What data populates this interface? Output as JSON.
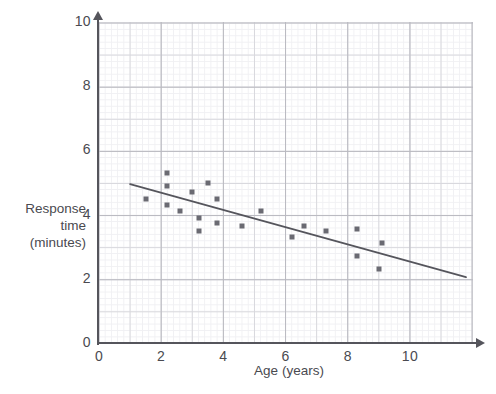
{
  "chart_data": {
    "type": "scatter",
    "title": "",
    "xlabel": "Age (years)",
    "ylabel": "Response time (minutes)",
    "ylabel_lines": [
      "Response",
      "time",
      "(minutes)"
    ],
    "xlim": [
      0,
      12
    ],
    "ylim": [
      0,
      10
    ],
    "x_ticks": [
      0,
      2,
      4,
      6,
      8,
      10
    ],
    "x_tick_labels": [
      "0",
      "2",
      "4",
      "6",
      "8",
      "10"
    ],
    "y_ticks": [
      0,
      2,
      4,
      6,
      8,
      10
    ],
    "y_tick_labels": [
      "0",
      "2",
      "4",
      "6",
      "8",
      "10"
    ],
    "grid": true,
    "grid_style": "graph-paper, minor 0.2 units, major 2 units",
    "legend": "none",
    "marker": "square",
    "marker_color": "#6a6a72",
    "points": [
      {
        "x": 1.5,
        "y": 4.5
      },
      {
        "x": 2.2,
        "y": 5.3
      },
      {
        "x": 2.2,
        "y": 4.9
      },
      {
        "x": 2.2,
        "y": 4.3
      },
      {
        "x": 2.6,
        "y": 4.1
      },
      {
        "x": 3.0,
        "y": 4.7
      },
      {
        "x": 3.2,
        "y": 3.9
      },
      {
        "x": 3.2,
        "y": 3.5
      },
      {
        "x": 3.5,
        "y": 5.0
      },
      {
        "x": 3.8,
        "y": 4.5
      },
      {
        "x": 3.8,
        "y": 3.75
      },
      {
        "x": 4.6,
        "y": 3.65
      },
      {
        "x": 5.2,
        "y": 4.1
      },
      {
        "x": 6.2,
        "y": 3.3
      },
      {
        "x": 6.6,
        "y": 3.65
      },
      {
        "x": 7.3,
        "y": 3.5
      },
      {
        "x": 8.3,
        "y": 3.55
      },
      {
        "x": 8.3,
        "y": 2.7
      },
      {
        "x": 9.0,
        "y": 2.3
      },
      {
        "x": 9.1,
        "y": 3.1
      }
    ],
    "trend_line": {
      "type": "line-of-best-fit",
      "color": "#55555c",
      "x_start": 1.0,
      "y_start": 4.95,
      "x_end": 11.8,
      "y_end": 2.05
    }
  },
  "axes": {
    "y_label_lines": [
      "Response",
      "time",
      "(minutes)"
    ],
    "x_label": "Age (years)",
    "y_ticks": [
      {
        "value": 10,
        "label": "10"
      },
      {
        "value": 8,
        "label": "8"
      },
      {
        "value": 6,
        "label": "6"
      },
      {
        "value": 4,
        "label": "4"
      },
      {
        "value": 2,
        "label": "2"
      },
      {
        "value": 0,
        "label": "0"
      }
    ],
    "x_ticks": [
      {
        "value": 0,
        "label": "0"
      },
      {
        "value": 2,
        "label": "2"
      },
      {
        "value": 4,
        "label": "4"
      },
      {
        "value": 6,
        "label": "6"
      },
      {
        "value": 8,
        "label": "8"
      },
      {
        "value": 10,
        "label": "10"
      }
    ]
  },
  "colors": {
    "marker": "#6a6a72",
    "axis": "#55555c",
    "grid_minor": "#f0f0f3",
    "grid_mid": "#d8d8dd",
    "grid_major": "#b9b9c0",
    "text": "#4a4a50",
    "background": "#ffffff"
  }
}
